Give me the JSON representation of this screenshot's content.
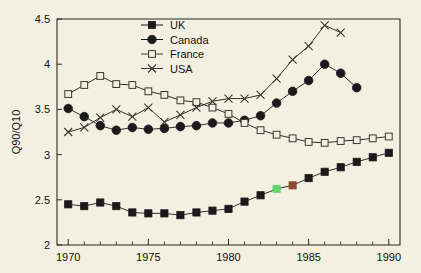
{
  "chart_data": {
    "type": "line",
    "title": "",
    "subtitle": "",
    "xlabel": "",
    "ylabel": "Q90/Q10",
    "xlim": [
      1969.3,
      1990.7
    ],
    "ylim": [
      2,
      4.5
    ],
    "grid": false,
    "legend_position": "top-center",
    "y_ticks": [
      "2",
      "2.5",
      "3",
      "3.5",
      "4",
      "4.5"
    ],
    "y_tick_values": [
      2,
      2.5,
      3,
      3.5,
      4,
      4.5
    ],
    "x_ticks": [
      "1970",
      "1975",
      "1980",
      "1985",
      "1990"
    ],
    "x_tick_values": [
      1970,
      1975,
      1980,
      1985,
      1990
    ],
    "x_minor_step": 1,
    "series": [
      {
        "name": "UK",
        "marker": "filled-square",
        "color": "#1a1a1a",
        "x": [
          1970,
          1971,
          1972,
          1973,
          1974,
          1975,
          1976,
          1977,
          1978,
          1979,
          1980,
          1981,
          1982,
          1983,
          1984,
          1985,
          1986,
          1987,
          1988,
          1989,
          1990
        ],
        "values": [
          2.45,
          2.43,
          2.47,
          2.43,
          2.36,
          2.35,
          2.35,
          2.33,
          2.36,
          2.38,
          2.4,
          2.48,
          2.55,
          2.62,
          2.66,
          2.74,
          2.81,
          2.86,
          2.92,
          2.97,
          3.02
        ],
        "highlight_points": [
          {
            "x": 1983,
            "color": "#63d471"
          },
          {
            "x": 1984,
            "color": "#8a4b30"
          }
        ]
      },
      {
        "name": "Canada",
        "marker": "filled-circle",
        "color": "#1a1a1a",
        "x": [
          1970,
          1971,
          1972,
          1973,
          1974,
          1975,
          1976,
          1977,
          1978,
          1979,
          1980,
          1981,
          1982,
          1983,
          1984,
          1985,
          1986,
          1987,
          1988
        ],
        "values": [
          3.51,
          3.42,
          3.32,
          3.27,
          3.3,
          3.28,
          3.29,
          3.31,
          3.32,
          3.35,
          3.35,
          3.38,
          3.43,
          3.57,
          3.7,
          3.82,
          4.0,
          3.9,
          3.74
        ]
      },
      {
        "name": "France",
        "marker": "open-square",
        "color": "#3a382f",
        "x": [
          1970,
          1971,
          1972,
          1973,
          1974,
          1975,
          1976,
          1977,
          1978,
          1979,
          1980,
          1981,
          1982,
          1983,
          1984,
          1985,
          1986,
          1987,
          1988,
          1989,
          1990
        ],
        "values": [
          3.67,
          3.77,
          3.87,
          3.78,
          3.77,
          3.7,
          3.66,
          3.6,
          3.58,
          3.52,
          3.45,
          3.35,
          3.27,
          3.22,
          3.18,
          3.14,
          3.13,
          3.15,
          3.16,
          3.18,
          3.2
        ]
      },
      {
        "name": "USA",
        "marker": "cross-x",
        "color": "#3a382f",
        "x": [
          1970,
          1971,
          1972,
          1973,
          1974,
          1975,
          1976,
          1977,
          1978,
          1979,
          1980,
          1981,
          1982,
          1983,
          1984,
          1985,
          1986,
          1987
        ],
        "values": [
          3.25,
          3.3,
          3.41,
          3.5,
          3.42,
          3.52,
          3.36,
          3.44,
          3.52,
          3.59,
          3.62,
          3.62,
          3.66,
          3.84,
          4.05,
          4.2,
          4.43,
          4.35
        ]
      }
    ]
  },
  "legend": {
    "items": [
      {
        "label": "UK"
      },
      {
        "label": "Canada"
      },
      {
        "label": "France"
      },
      {
        "label": "USA"
      }
    ]
  }
}
